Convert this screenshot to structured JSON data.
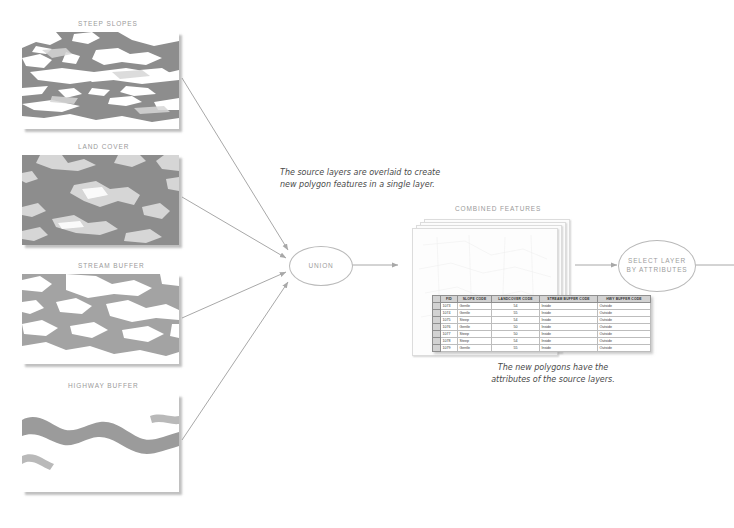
{
  "diagram": {
    "title_note_top": {
      "line1": "The source layers are overlaid to create",
      "line2": "new polygon features in a single layer."
    },
    "title_note_bottom": {
      "line1": "The new polygons have the",
      "line2": "attributes of the source layers."
    }
  },
  "source_layers": [
    {
      "id": "steep-slopes",
      "label": "STEEP SLOPES"
    },
    {
      "id": "land-cover",
      "label": "LAND COVER"
    },
    {
      "id": "stream-buffer",
      "label": "STREAM BUFFER"
    },
    {
      "id": "highway-buffer",
      "label": "HIGHWAY BUFFER"
    }
  ],
  "processes": [
    {
      "id": "union",
      "line1": "UNION",
      "line2": ""
    },
    {
      "id": "select-layer-by-attributes",
      "line1": "SELECT LAYER",
      "line2": "BY ATTRIBUTES"
    }
  ],
  "output": {
    "label": "COMBINED FEATURES"
  },
  "attribute_table": {
    "columns": [
      "FID",
      "SLOPE CODE",
      "LANDCOVER CODE",
      "STREAM BUFFER CODE",
      "HWY BUFFER CODE"
    ],
    "rows": [
      {
        "fid": "1073",
        "slope_code": "Gentle",
        "landcover_code": "54",
        "stream_buffer_code": "Inside",
        "hwy_buffer_code": "Outside"
      },
      {
        "fid": "1074",
        "slope_code": "Gentle",
        "landcover_code": "55",
        "stream_buffer_code": "Inside",
        "hwy_buffer_code": "Outside"
      },
      {
        "fid": "1075",
        "slope_code": "Steep",
        "landcover_code": "54",
        "stream_buffer_code": "Inside",
        "hwy_buffer_code": "Outside"
      },
      {
        "fid": "1076",
        "slope_code": "Gentle",
        "landcover_code": "50",
        "stream_buffer_code": "Inside",
        "hwy_buffer_code": "Outside"
      },
      {
        "fid": "1077",
        "slope_code": "Steep",
        "landcover_code": "50",
        "stream_buffer_code": "Inside",
        "hwy_buffer_code": "Outside"
      },
      {
        "fid": "1078",
        "slope_code": "Steep",
        "landcover_code": "54",
        "stream_buffer_code": "Inside",
        "hwy_buffer_code": "Outside"
      },
      {
        "fid": "1079",
        "slope_code": "Gentle",
        "landcover_code": "55",
        "stream_buffer_code": "Inside",
        "hwy_buffer_code": "Outside"
      }
    ]
  },
  "colors": {
    "map_dark": "#8d8d8d",
    "map_light": "#d6d6d6",
    "map_white": "#ffffff",
    "label_text": "#9a9a9a",
    "note_text": "#4a4a4a",
    "outline": "#b9b9b9",
    "arrow": "#a8a8a8",
    "table_header_bg": "#d2d2d2"
  }
}
